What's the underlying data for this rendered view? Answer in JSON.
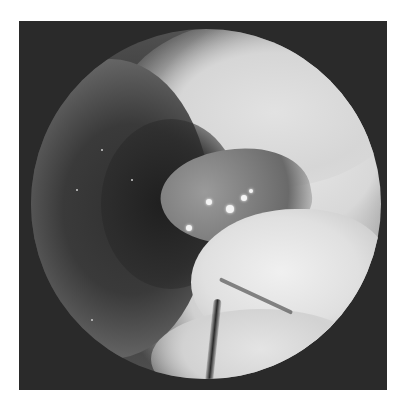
{
  "image": {
    "description": "Grayscale endoscopic view: circular field of view within dark square frame",
    "type": "endoscopy-photograph",
    "colors": {
      "page_background": "#ffffff",
      "frame_background": "#2a2a2a",
      "mucosa_light": "#e6e6e6",
      "lumen_dark": "#1f1f1f",
      "lesion_mid": "#7f7f7f",
      "highlight": "#f4f4f4"
    },
    "features": [
      {
        "name": "circular-scope-field"
      },
      {
        "name": "dark-lumen"
      },
      {
        "name": "granular-lesion",
        "highlight_count": 5
      },
      {
        "name": "smooth-mucosal-bulge"
      },
      {
        "name": "vessel-streak"
      }
    ]
  }
}
